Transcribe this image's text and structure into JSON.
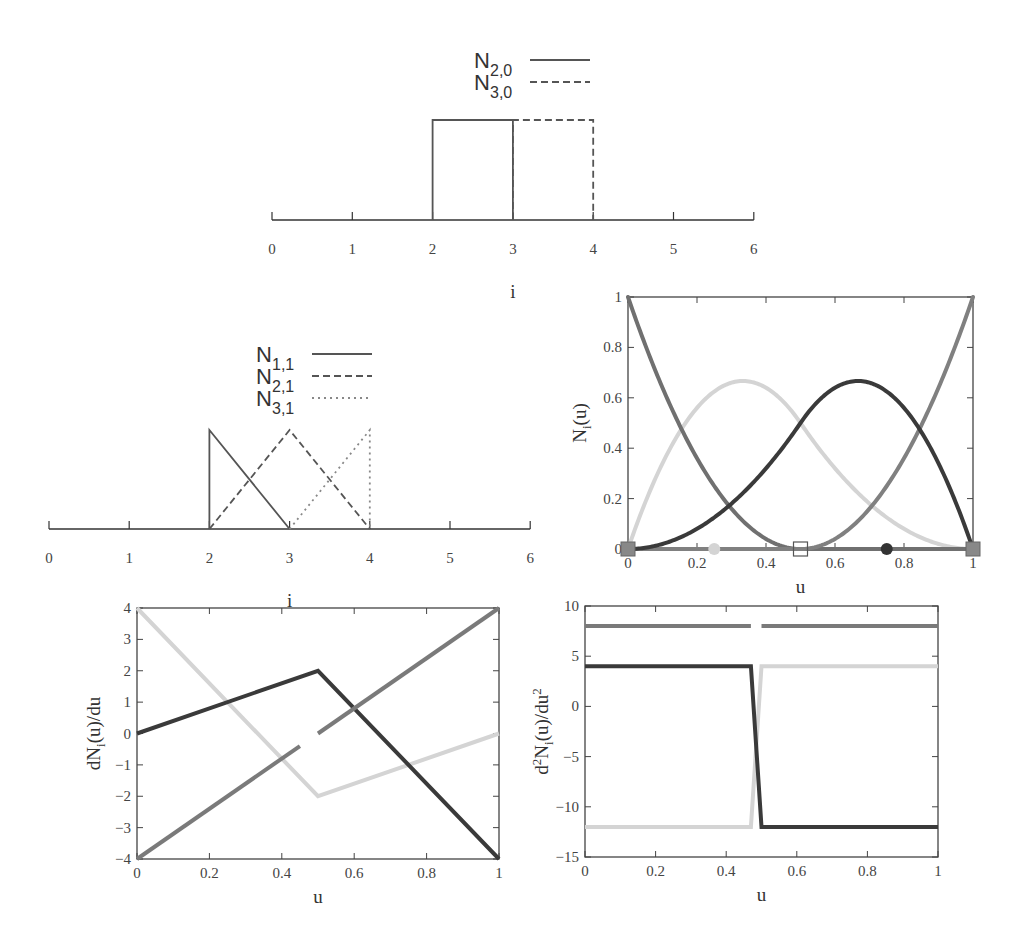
{
  "chart_data": [
    {
      "id": "basis_deg0",
      "type": "line",
      "title": "",
      "xlabel": "i",
      "ylabel": "",
      "xlim": [
        0,
        6
      ],
      "xticks": [
        "0",
        "1",
        "2",
        "3",
        "4",
        "5",
        "6"
      ],
      "legend": [
        {
          "label": "N",
          "sub": "2,0",
          "style": "solid"
        },
        {
          "label": "N",
          "sub": "3,0",
          "style": "dashed"
        }
      ],
      "series": [
        {
          "name": "N2,0",
          "style": "solid",
          "x": [
            2,
            2,
            3,
            3
          ],
          "y": [
            0,
            1,
            1,
            0
          ]
        },
        {
          "name": "N3,0",
          "style": "dashed",
          "x": [
            3,
            3,
            4,
            4
          ],
          "y": [
            0,
            1,
            1,
            0
          ]
        }
      ]
    },
    {
      "id": "basis_deg1",
      "type": "line",
      "title": "",
      "xlabel": "i",
      "ylabel": "",
      "xlim": [
        0,
        6
      ],
      "xticks": [
        "0",
        "1",
        "2",
        "3",
        "4",
        "5",
        "6"
      ],
      "legend": [
        {
          "label": "N",
          "sub": "1,1",
          "style": "solid"
        },
        {
          "label": "N",
          "sub": "2,1",
          "style": "dashed"
        },
        {
          "label": "N",
          "sub": "3,1",
          "style": "dotted"
        }
      ],
      "series": [
        {
          "name": "N1,1",
          "style": "solid",
          "x": [
            2,
            2,
            3
          ],
          "y": [
            0,
            1,
            0
          ]
        },
        {
          "name": "N2,1",
          "style": "dashed",
          "x": [
            2,
            3,
            4
          ],
          "y": [
            0,
            1,
            0
          ]
        },
        {
          "name": "N3,1",
          "style": "dotted",
          "x": [
            3,
            4,
            4
          ],
          "y": [
            0,
            1,
            0
          ]
        }
      ]
    },
    {
      "id": "basis_quadratic",
      "type": "line",
      "title": "",
      "xlabel": "u",
      "ylabel": "N_i(u)",
      "xlim": [
        0,
        1
      ],
      "ylim": [
        0,
        1
      ],
      "xticks": [
        "0",
        "0.2",
        "0.4",
        "0.6",
        "0.8",
        "1"
      ],
      "yticks": [
        "0",
        "0.2",
        "0.4",
        "0.6",
        "0.8",
        "1"
      ],
      "series": [
        {
          "name": "N0",
          "color": "#707070",
          "x": [
            0,
            0.25,
            0.5,
            0.75,
            1
          ],
          "y": [
            1,
            0.25,
            0,
            0,
            0
          ]
        },
        {
          "name": "N1",
          "color": "#d4d4d4",
          "x": [
            0,
            0.25,
            0.333,
            0.5,
            0.75,
            1
          ],
          "y": [
            0,
            0.625,
            0.667,
            0.5,
            0.125,
            0
          ]
        },
        {
          "name": "N2",
          "color": "#3a3a3a",
          "x": [
            0,
            0.25,
            0.5,
            0.667,
            0.75,
            1
          ],
          "y": [
            0,
            0.125,
            0.5,
            0.667,
            0.625,
            0
          ]
        },
        {
          "name": "N3",
          "color": "#808080",
          "x": [
            0,
            0.25,
            0.5,
            0.75,
            1
          ],
          "y": [
            0,
            0,
            0,
            0.25,
            1
          ]
        }
      ],
      "markers": [
        {
          "u": 0,
          "shape": "square-filled",
          "color": "#888888"
        },
        {
          "u": 0.25,
          "shape": "circle-filled",
          "color": "#d4d4d4"
        },
        {
          "u": 0.5,
          "shape": "square-open",
          "color": "#555555"
        },
        {
          "u": 0.75,
          "shape": "circle-filled",
          "color": "#333333"
        },
        {
          "u": 1,
          "shape": "square-filled",
          "color": "#888888"
        }
      ]
    },
    {
      "id": "first_derivative",
      "type": "line",
      "title": "",
      "xlabel": "u",
      "ylabel": "dN_i(u)/du",
      "xlim": [
        0,
        1
      ],
      "ylim": [
        -4,
        4
      ],
      "xticks": [
        "0",
        "0.2",
        "0.4",
        "0.6",
        "0.8",
        "1"
      ],
      "yticks": [
        "-4",
        "-3",
        "-2",
        "-1",
        "0",
        "1",
        "2",
        "3",
        "4"
      ],
      "series": [
        {
          "name": "dN0",
          "color": "#d4d4d4",
          "x": [
            0,
            0.5,
            1
          ],
          "y": [
            4,
            -2,
            0
          ]
        },
        {
          "name": "dN1",
          "color": "#3a3a3a",
          "x": [
            0,
            0.5,
            1
          ],
          "y": [
            0,
            2,
            -4
          ]
        },
        {
          "name": "dN2a",
          "color": "#7a7a7a",
          "x": [
            0,
            0.45
          ],
          "y": [
            -4,
            -0.4
          ]
        },
        {
          "name": "dN2b",
          "color": "#7a7a7a",
          "x": [
            0.5,
            1
          ],
          "y": [
            0,
            4
          ]
        }
      ]
    },
    {
      "id": "second_derivative",
      "type": "line",
      "title": "",
      "xlabel": "u",
      "ylabel": "d^2N_i(u)/du^2",
      "xlim": [
        0,
        1
      ],
      "ylim": [
        -15,
        10
      ],
      "xticks": [
        "0",
        "0.2",
        "0.4",
        "0.6",
        "0.8",
        "1"
      ],
      "yticks": [
        "-15",
        "-10",
        "-5",
        "0",
        "5",
        "10"
      ],
      "series": [
        {
          "name": "d2N_top_a",
          "color": "#7a7a7a",
          "x": [
            0,
            0.47
          ],
          "y": [
            8,
            8
          ]
        },
        {
          "name": "d2N_top_b",
          "color": "#7a7a7a",
          "x": [
            0.5,
            1
          ],
          "y": [
            8,
            8
          ]
        },
        {
          "name": "d2N_light",
          "color": "#d4d4d4",
          "x": [
            0,
            0.47,
            0.5,
            1
          ],
          "y": [
            -12,
            -12,
            4,
            4
          ]
        },
        {
          "name": "d2N_dark",
          "color": "#3a3a3a",
          "x": [
            0,
            0.47,
            0.5,
            1
          ],
          "y": [
            4,
            4,
            -12,
            -12
          ]
        }
      ]
    }
  ]
}
